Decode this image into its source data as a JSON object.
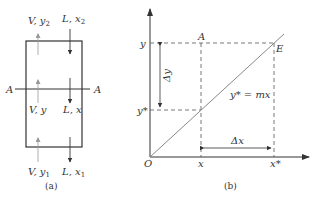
{
  "panel_a": {
    "caption": "(a)",
    "section_label_left": "A",
    "section_label_right": "A",
    "top_vapor": "V, y",
    "top_vapor_sub": "2",
    "top_liquid": "L, x",
    "top_liquid_sub": "2",
    "mid_vapor": "V, y",
    "mid_liquid": "L, x",
    "bottom_vapor": "V, y",
    "bottom_vapor_sub": "1",
    "bottom_liquid": "L, x",
    "bottom_liquid_sub": "1"
  },
  "panel_b": {
    "caption": "(b)",
    "origin": "O",
    "y_label": "y",
    "y_star_label": "y*",
    "x_label": "x",
    "x_star_label": "x*",
    "point_a": "A",
    "point_e": "E",
    "delta_y": "Δy",
    "delta_x": "Δx",
    "equation": "y* = mx"
  },
  "colors": {
    "line": "#333333",
    "dashed": "#555555",
    "thin_arrow": "#999999"
  }
}
